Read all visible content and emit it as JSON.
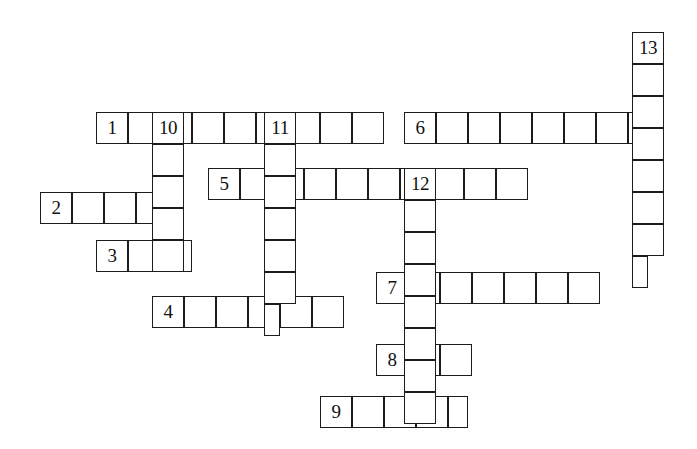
{
  "puzzle": {
    "title": "Crossword puzzle grid",
    "cell_size": 32,
    "origin_x": 40,
    "origin_y": 32,
    "background_color": "#ffffff",
    "line_color": "#1b1b1b",
    "number_color": "#111111",
    "entries": [
      {
        "label": "1",
        "direction": "across",
        "col": 1.75,
        "row": 2.5,
        "length": 9
      },
      {
        "label": "2",
        "direction": "across",
        "col": 0,
        "row": 5,
        "length": 4
      },
      {
        "label": "3",
        "direction": "across",
        "col": 1.75,
        "row": 6.5,
        "length": 3
      },
      {
        "label": "4",
        "direction": "across",
        "col": 3.5,
        "row": 8.25,
        "length": 6
      },
      {
        "label": "5",
        "direction": "across",
        "col": 5.25,
        "row": 4.25,
        "length": 10
      },
      {
        "label": "6",
        "direction": "across",
        "col": 11.375,
        "row": 2.5,
        "length": 8
      },
      {
        "label": "7",
        "direction": "across",
        "col": 10.5,
        "row": 7.5,
        "length": 7
      },
      {
        "label": "8",
        "direction": "across",
        "col": 10.5,
        "row": 9.75,
        "length": 3
      },
      {
        "label": "9",
        "direction": "across",
        "col": 8.75,
        "row": 11.375,
        "length": 4.625
      },
      {
        "label": "10",
        "direction": "down",
        "col": 3.5,
        "row": 2.5,
        "length": 5
      },
      {
        "label": "11",
        "direction": "down",
        "col": 7,
        "row": 2.5,
        "length": 6.5
      },
      {
        "label": "12",
        "direction": "down",
        "col": 11.375,
        "row": 4.25,
        "length": 8
      },
      {
        "label": "13",
        "direction": "down",
        "col": 18.5,
        "row": 0,
        "length": 7.5
      }
    ]
  }
}
